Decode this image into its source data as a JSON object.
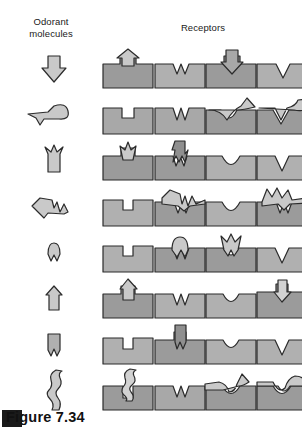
{
  "figure": {
    "caption": "Figure 7.34",
    "headers": {
      "odorant": "Odorant\nmolecules",
      "receptors": "Receptors"
    },
    "colors": {
      "block_fill": "#a8a8a8",
      "block_fill_dark": "#9b9b9b",
      "block_fill_light": "#bdbdbd",
      "molecule_fill": "#c9c9c9",
      "outline": "#2b2b2b",
      "background": "#ffffff",
      "caption_bar": "#1a1a1a",
      "text": "#1a1a1a"
    },
    "columns": [
      {
        "name": "odorant-molecule",
        "label": "Odorant molecules"
      },
      {
        "name": "receptor-1",
        "label": "Receptor 1"
      },
      {
        "name": "receptor-2",
        "label": "Receptor 2"
      },
      {
        "name": "receptor-3",
        "label": "Receptor 3"
      },
      {
        "name": "receptor-4",
        "label": "Receptor 4"
      }
    ],
    "rows": [
      {
        "index": 1,
        "molecule": "down-arrow-plug",
        "receptors": [
          {
            "shape": "square-slot",
            "state": "protruding-arrow-up"
          },
          {
            "shape": "w-notch",
            "state": "empty"
          },
          {
            "shape": "square-slot",
            "state": "bound-arrow-inserted"
          },
          {
            "shape": "v-notch",
            "state": "empty"
          }
        ]
      },
      {
        "index": 2,
        "molecule": "horizontal-v-tail-round-head",
        "receptors": [
          {
            "shape": "square-slot",
            "state": "empty"
          },
          {
            "shape": "w-notch",
            "state": "empty"
          },
          {
            "shape": "u-notch",
            "state": "bound-lying-across"
          },
          {
            "shape": "v-notch",
            "state": "bound-lying-across"
          }
        ]
      },
      {
        "index": 3,
        "molecule": "up-arrow-crown-top",
        "receptors": [
          {
            "shape": "square-slot",
            "state": "protruding-crown-arrow"
          },
          {
            "shape": "w-notch",
            "state": "bound-crown-arrow"
          },
          {
            "shape": "u-notch",
            "state": "empty"
          },
          {
            "shape": "v-notch",
            "state": "empty"
          }
        ]
      },
      {
        "index": 4,
        "molecule": "horizontal-point-left-w-right",
        "receptors": [
          {
            "shape": "square-slot",
            "state": "empty"
          },
          {
            "shape": "w-notch",
            "state": "bound-across"
          },
          {
            "shape": "u-notch",
            "state": "empty"
          },
          {
            "shape": "w-notch",
            "state": "bound-across-raised"
          }
        ]
      },
      {
        "index": 5,
        "molecule": "small-round-top-w-bottom",
        "receptors": [
          {
            "shape": "square-slot",
            "state": "empty"
          },
          {
            "shape": "w-notch",
            "state": "bound-round-cap"
          },
          {
            "shape": "u-notch",
            "state": "bound-crown-cap"
          },
          {
            "shape": "v-notch",
            "state": "empty"
          }
        ]
      },
      {
        "index": 6,
        "molecule": "pentagon-home-plate",
        "receptors": [
          {
            "shape": "square-slot",
            "state": "protruding-pentagon"
          },
          {
            "shape": "w-notch",
            "state": "empty"
          },
          {
            "shape": "u-notch",
            "state": "empty"
          },
          {
            "shape": "square-slot",
            "state": "bound-pentagon-inserted"
          }
        ]
      },
      {
        "index": 7,
        "molecule": "square-w-bottom",
        "receptors": [
          {
            "shape": "square-slot",
            "state": "empty"
          },
          {
            "shape": "square-slot",
            "state": "bound-square-w-inserted"
          },
          {
            "shape": "u-notch",
            "state": "empty"
          },
          {
            "shape": "v-notch",
            "state": "empty"
          }
        ]
      },
      {
        "index": 8,
        "molecule": "vertical-squiggle",
        "receptors": [
          {
            "shape": "square-slot",
            "state": "protruding-squiggle"
          },
          {
            "shape": "w-notch",
            "state": "empty"
          },
          {
            "shape": "u-notch",
            "state": "bound-lying-across"
          },
          {
            "shape": "u-notch",
            "state": "bound-cap-across"
          }
        ]
      }
    ]
  }
}
